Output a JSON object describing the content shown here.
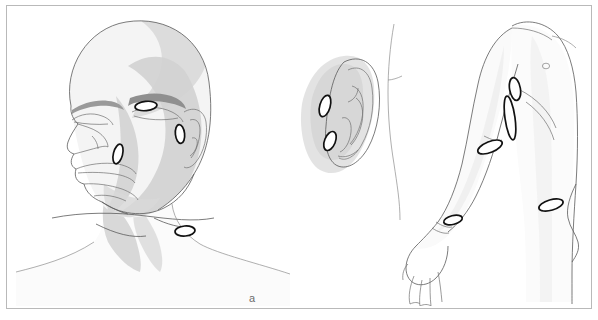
{
  "figure": {
    "background_color": "#ffffff",
    "frame_color": "#b9b9b9",
    "lesion_outline_color": "#111111",
    "lesion_fill_color": "#ffffff",
    "line_color": "#5a5a5a",
    "shade_light": "#ededed",
    "shade_mid": "#dcdcdc",
    "shade_dark": "#c9c9c9",
    "label_color": "#6d6d6d"
  },
  "panels": [
    {
      "id": "a",
      "label": "a",
      "subject": "head-and-neck-anterolateral-view",
      "lesion_count": 4,
      "lesions": [
        {
          "name": "lesion-lateral-eyebrow",
          "region": "lateral eyebrow / supraorbital",
          "orientation": "horizontal"
        },
        {
          "name": "lesion-preauricular",
          "region": "preauricular temple",
          "orientation": "vertical"
        },
        {
          "name": "lesion-cheek",
          "region": "medial cheek / nasolabial",
          "orientation": "vertical"
        },
        {
          "name": "lesion-supraclavicular",
          "region": "supraclavicular neck",
          "orientation": "horizontal"
        }
      ]
    },
    {
      "id": "b",
      "label": "b",
      "subject": "external-ear-lateral-view",
      "lesion_count": 2,
      "lesions": [
        {
          "name": "lesion-upper-preauricular",
          "region": "upper preauricular / helical root",
          "orientation": "oblique"
        },
        {
          "name": "lesion-lower-preauricular",
          "region": "lower preauricular / tragus",
          "orientation": "oblique"
        }
      ]
    },
    {
      "id": "c",
      "label": "c",
      "subject": "upper-limb-and-trunk-lateral-view",
      "lesion_count": 5,
      "lesions": [
        {
          "name": "lesion-deltoid",
          "region": "deltoid / shoulder",
          "orientation": "vertical"
        },
        {
          "name": "lesion-axilla",
          "region": "axilla / anterior fold",
          "orientation": "elongated-vertical"
        },
        {
          "name": "lesion-upper-arm",
          "region": "medial upper arm / elbow",
          "orientation": "oblique"
        },
        {
          "name": "lesion-wrist",
          "region": "volar wrist",
          "orientation": "horizontal"
        },
        {
          "name": "lesion-flank",
          "region": "flank / iliac crest",
          "orientation": "horizontal"
        }
      ]
    }
  ]
}
